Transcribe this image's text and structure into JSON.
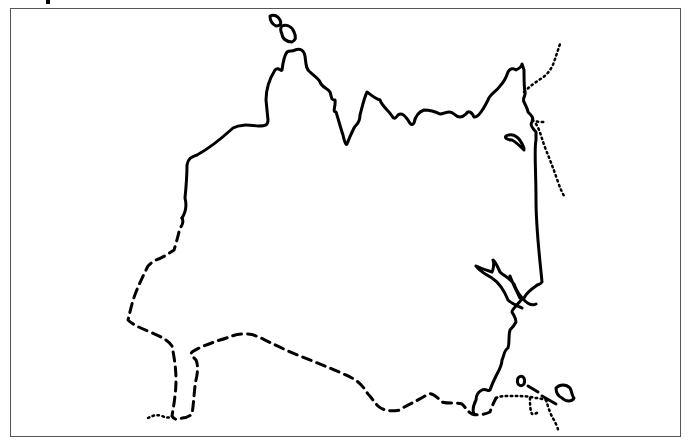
{
  "map": {
    "type": "outline-map",
    "styles": {
      "coastline": {
        "color": "#000000",
        "stroke": "solid",
        "width": 3
      },
      "land_border": {
        "color": "#000000",
        "stroke": "dashed",
        "width": 3
      },
      "other_border": {
        "color": "#000000",
        "stroke": "dotted",
        "width": 2.5
      }
    },
    "frame_color": "#555555"
  }
}
